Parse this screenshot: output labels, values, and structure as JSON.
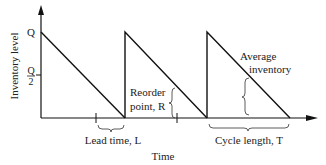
{
  "diagram": {
    "type": "inventory-sawtooth",
    "y_axis_label": "Inventory level",
    "x_axis_label": "Time",
    "y_ticks": {
      "q": "Q",
      "half_q_numerator": "Q",
      "half_q_denominator": "2"
    },
    "annotations": {
      "lead_time": "Lead time, L",
      "reorder_line1": "Reorder",
      "reorder_line2": "point, R",
      "average_line1": "Average",
      "average_line2": "inventory",
      "cycle_length": "Cycle length, T"
    },
    "cycles": 3
  }
}
